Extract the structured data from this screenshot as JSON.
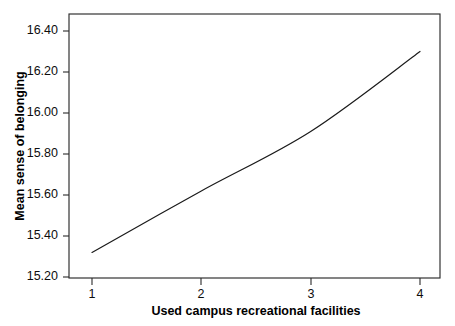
{
  "chart_data": {
    "type": "line",
    "title": "",
    "subtitle": "",
    "xlabel": "Used campus recreational facilities",
    "ylabel": "Mean sense of belonging",
    "x": [
      1,
      2,
      3,
      4
    ],
    "values": [
      15.32,
      15.62,
      15.91,
      16.3
    ],
    "series": [
      {
        "name": "Mean sense of belonging",
        "values": [
          15.32,
          15.62,
          15.91,
          16.3
        ],
        "color": "#1a1a1a"
      }
    ],
    "xlim": [
      1,
      4
    ],
    "ylim": [
      15.2,
      16.4
    ],
    "xticks": [
      1,
      2,
      3,
      4
    ],
    "xticklabels": [
      "1",
      "2",
      "3",
      "4"
    ],
    "yticks": [
      15.2,
      15.4,
      15.6,
      15.8,
      16.0,
      16.2,
      16.4
    ],
    "yticklabels": [
      "15.20",
      "15.40",
      "15.60",
      "15.80",
      "16.00",
      "16.20",
      "16.40"
    ],
    "grid": false,
    "legend": false,
    "legend_position": "none",
    "annotations": [],
    "frame_color": "#2b2b2b",
    "background_color": "#ffffff"
  },
  "axes": {
    "y": {
      "title": "Mean sense of belonging",
      "ticks": [
        {
          "label": "16.40",
          "value": 16.4
        },
        {
          "label": "16.20",
          "value": 16.2
        },
        {
          "label": "16.00",
          "value": 16.0
        },
        {
          "label": "15.80",
          "value": 15.8
        },
        {
          "label": "15.60",
          "value": 15.6
        },
        {
          "label": "15.40",
          "value": 15.4
        },
        {
          "label": "15.20",
          "value": 15.2
        }
      ]
    },
    "x": {
      "title": "Used campus recreational facilities",
      "ticks": [
        {
          "label": "1",
          "value": 1
        },
        {
          "label": "2",
          "value": 2
        },
        {
          "label": "3",
          "value": 3
        },
        {
          "label": "4",
          "value": 4
        }
      ]
    }
  }
}
